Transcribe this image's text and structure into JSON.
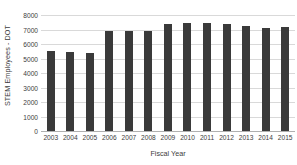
{
  "chart_data": {
    "type": "bar",
    "title": "",
    "xlabel": "Fiscal Year",
    "ylabel": "STEM Employees - DOT",
    "categories": [
      "2003",
      "2004",
      "2005",
      "2006",
      "2007",
      "2008",
      "2009",
      "2010",
      "2011",
      "2012",
      "2013",
      "2014",
      "2015"
    ],
    "values": [
      5530,
      5470,
      5410,
      6880,
      6880,
      6920,
      7380,
      7450,
      7420,
      7370,
      7210,
      7100,
      7150
    ],
    "series": [
      {
        "name": "STEM Employees - DOT",
        "values": [
          5530,
          5470,
          5410,
          6880,
          6880,
          6920,
          7380,
          7450,
          7420,
          7370,
          7210,
          7100,
          7150
        ]
      }
    ],
    "ylim": [
      0,
      8000
    ],
    "ytick_labels": [
      "0",
      "1000",
      "2000",
      "3000",
      "4000",
      "5000",
      "6000",
      "7000",
      "8000"
    ],
    "ytick_values": [
      0,
      1000,
      2000,
      3000,
      4000,
      5000,
      6000,
      7000,
      8000
    ],
    "grid": true,
    "legend": "none",
    "bar_color": "#3a3a3a",
    "gridline_color": "#d9d9d9",
    "background_color": "#ffffff"
  }
}
